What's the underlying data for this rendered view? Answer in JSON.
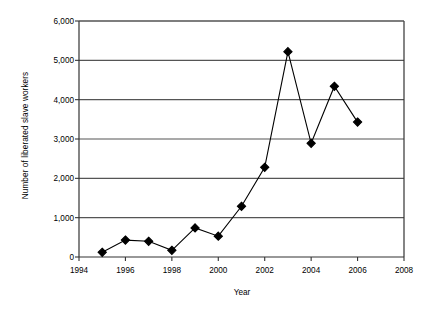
{
  "chart_data": {
    "type": "line",
    "title": "",
    "xlabel": "Year",
    "ylabel": "Number of liberated slave workers",
    "x": [
      1995,
      1996,
      1997,
      1998,
      1999,
      2000,
      2001,
      2002,
      2003,
      2004,
      2005,
      2006
    ],
    "values": [
      120,
      430,
      400,
      170,
      740,
      530,
      1290,
      2280,
      5220,
      2890,
      4340,
      3430
    ],
    "series": [
      {
        "name": "Liberated slave workers",
        "values": [
          120,
          430,
          400,
          170,
          740,
          530,
          1290,
          2280,
          5220,
          2890,
          4340,
          3430
        ]
      }
    ],
    "xlim": [
      1994,
      2008
    ],
    "ylim": [
      0,
      6000
    ],
    "xticks": [
      1994,
      1996,
      1998,
      2000,
      2002,
      2004,
      2006,
      2008
    ],
    "yticks": [
      0,
      1000,
      2000,
      3000,
      4000,
      5000,
      6000
    ],
    "xtick_labels": [
      "1994",
      "1996",
      "1998",
      "2000",
      "2002",
      "2004",
      "2006",
      "2008"
    ],
    "ytick_labels": [
      "0",
      "1,000",
      "2,000",
      "3,000",
      "4,000",
      "5,000",
      "6,000"
    ],
    "grid": "horizontal",
    "legend": "none",
    "marker": "diamond",
    "line_color": "#000000",
    "marker_color": "#000000",
    "grid_color": "#555555",
    "axis_color": "#333333",
    "background": "#ffffff"
  },
  "axis": {
    "y_title": "Number of liberated slave workers",
    "x_title": "Year"
  }
}
